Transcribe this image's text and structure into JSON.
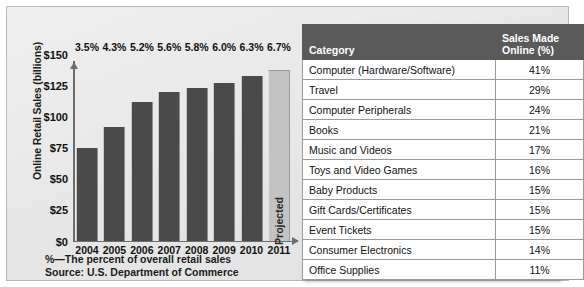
{
  "chart_data": {
    "type": "bar",
    "title": "",
    "xlabel": "",
    "ylabel": "Online Retail Sales (billions)",
    "ylim": [
      0,
      150
    ],
    "ytick_labels": [
      "$150",
      "$125",
      "$100",
      "$75",
      "$50",
      "$25",
      "$0"
    ],
    "ytick_values": [
      150,
      125,
      100,
      75,
      50,
      25,
      0
    ],
    "grid": false,
    "legend": "none",
    "categories": [
      "2004",
      "2005",
      "2006",
      "2007",
      "2008",
      "2009",
      "2010",
      "2011"
    ],
    "values": [
      74,
      91,
      111,
      119,
      122,
      126,
      132,
      137
    ],
    "point_labels": [
      "3.5%",
      "4.3%",
      "5.2%",
      "5.6%",
      "5.8%",
      "6.0%",
      "6.3%",
      "6.7%"
    ],
    "bars": [
      {
        "year": "2004",
        "value": 74,
        "pct_label": "3.5%",
        "projected": false,
        "note": ""
      },
      {
        "year": "2005",
        "value": 91,
        "pct_label": "4.3%",
        "projected": false,
        "note": ""
      },
      {
        "year": "2006",
        "value": 111,
        "pct_label": "5.2%",
        "projected": false,
        "note": ""
      },
      {
        "year": "2007",
        "value": 119,
        "pct_label": "5.6%",
        "projected": false,
        "note": ""
      },
      {
        "year": "2008",
        "value": 122,
        "pct_label": "5.8%",
        "projected": false,
        "note": ""
      },
      {
        "year": "2009",
        "value": 126,
        "pct_label": "6.0%",
        "projected": false,
        "note": ""
      },
      {
        "year": "2010",
        "value": 132,
        "pct_label": "6.3%",
        "projected": false,
        "note": ""
      },
      {
        "year": "2011",
        "value": 137,
        "pct_label": "6.7%",
        "projected": true,
        "note": "Projected"
      }
    ],
    "annotations": [
      "%—The percent of overall retail sales",
      "Source: U.S. Department of Commerce"
    ],
    "colors": {
      "bar": "#4a4a4a",
      "bar_projected": "#c3c3c3",
      "axis": "#6d6d6d",
      "panel_background": "#e9e9e9",
      "text": "#111111"
    }
  },
  "caption": {
    "line1": "%—The percent of overall retail sales",
    "line2": "Source: U.S. Department of Commerce"
  },
  "table": {
    "headers": {
      "category": "Category",
      "percent_line1": "Sales Made",
      "percent_line2": "Online (%)"
    },
    "header_background": "#5a5a5a",
    "rows": [
      {
        "category": "Computer (Hardware/Software)",
        "percent": "41%"
      },
      {
        "category": "Travel",
        "percent": "29%"
      },
      {
        "category": "Computer Peripherals",
        "percent": "24%"
      },
      {
        "category": "Books",
        "percent": "21%"
      },
      {
        "category": "Music and Videos",
        "percent": "17%"
      },
      {
        "category": "Toys and Video Games",
        "percent": "16%"
      },
      {
        "category": "Baby Products",
        "percent": "15%"
      },
      {
        "category": "Gift Cards/Certificates",
        "percent": "15%"
      },
      {
        "category": "Event Tickets",
        "percent": "15%"
      },
      {
        "category": "Consumer Electronics",
        "percent": "14%"
      },
      {
        "category": "Office Supplies",
        "percent": "11%"
      }
    ]
  }
}
